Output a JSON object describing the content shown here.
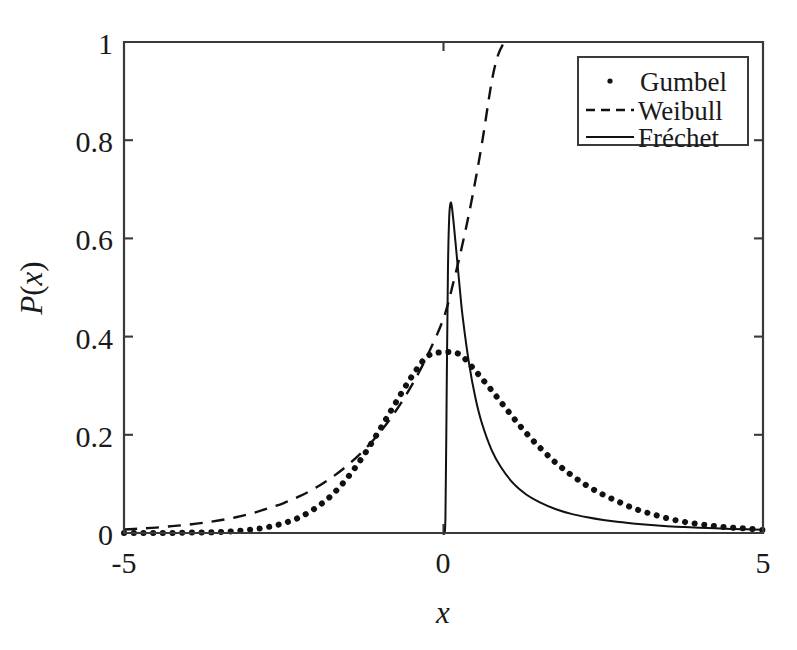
{
  "chart_data": {
    "type": "line",
    "title": "",
    "xlabel": "x",
    "ylabel": "P(x)",
    "xlim": [
      -5,
      5
    ],
    "ylim": [
      0,
      1
    ],
    "grid": false,
    "legend_position": "top-right",
    "xticks": [
      -5,
      0,
      5
    ],
    "xtick_labels": [
      "-5",
      "0",
      "5"
    ],
    "yticks": [
      0,
      0.2,
      0.4,
      0.6,
      0.8,
      1
    ],
    "ytick_labels": [
      "0",
      "0.2",
      "0.4",
      "0.6",
      "0.8",
      "1"
    ],
    "series": [
      {
        "name": "Gumbel",
        "style": "dotted",
        "color": "#111111",
        "x": [
          -5,
          -4.75,
          -4.5,
          -4.25,
          -4,
          -3.75,
          -3.5,
          -3.25,
          -3,
          -2.75,
          -2.5,
          -2.25,
          -2,
          -1.75,
          -1.5,
          -1.25,
          -1,
          -0.75,
          -0.5,
          -0.25,
          0,
          0.25,
          0.5,
          0.75,
          1,
          1.25,
          1.5,
          1.75,
          2,
          2.25,
          2.5,
          2.75,
          3,
          3.25,
          3.5,
          3.75,
          4,
          4.25,
          4.5,
          4.75,
          5
        ],
        "y": [
          0.0,
          0.0,
          0.0,
          0.0,
          0.001,
          0.001,
          0.002,
          0.004,
          0.007,
          0.012,
          0.02,
          0.032,
          0.051,
          0.077,
          0.113,
          0.158,
          0.21,
          0.265,
          0.318,
          0.36,
          0.368,
          0.364,
          0.33,
          0.291,
          0.25,
          0.21,
          0.175,
          0.144,
          0.118,
          0.096,
          0.078,
          0.063,
          0.049,
          0.039,
          0.03,
          0.023,
          0.018,
          0.014,
          0.011,
          0.009,
          0.006
        ]
      },
      {
        "name": "Weibull",
        "style": "dashed",
        "color": "#111111",
        "x": [
          -5,
          -4.75,
          -4.5,
          -4.25,
          -4,
          -3.75,
          -3.5,
          -3.25,
          -3,
          -2.75,
          -2.5,
          -2.25,
          -2,
          -1.75,
          -1.5,
          -1.25,
          -1,
          -0.75,
          -0.5,
          -0.25,
          0,
          0.15,
          0.3,
          0.45,
          0.6,
          0.75,
          0.85,
          0.95
        ],
        "y": [
          0.007,
          0.009,
          0.011,
          0.014,
          0.017,
          0.021,
          0.026,
          0.032,
          0.04,
          0.05,
          0.061,
          0.075,
          0.092,
          0.113,
          0.138,
          0.168,
          0.204,
          0.248,
          0.3,
          0.362,
          0.437,
          0.508,
          0.59,
          0.684,
          0.792,
          0.916,
          0.972,
          1.0
        ]
      },
      {
        "name": "Fréchet",
        "style": "solid",
        "color": "#111111",
        "x": [
          0,
          0.002,
          0.03,
          0.05,
          0.07,
          0.09,
          0.11,
          0.13,
          0.16,
          0.2,
          0.25,
          0.3,
          0.4,
          0.5,
          0.6,
          0.75,
          0.9,
          1.1,
          1.3,
          1.5,
          1.75,
          2,
          2.25,
          2.5,
          2.75,
          3,
          3.25,
          3.5,
          3.75,
          4,
          4.25,
          4.5,
          4.75,
          5
        ],
        "y": [
          0.0,
          0.0,
          0.03,
          0.29,
          0.54,
          0.645,
          0.672,
          0.665,
          0.63,
          0.575,
          0.505,
          0.44,
          0.345,
          0.275,
          0.224,
          0.17,
          0.134,
          0.1,
          0.078,
          0.063,
          0.049,
          0.039,
          0.032,
          0.0265,
          0.0222,
          0.0189,
          0.0162,
          0.014,
          0.0122,
          0.0107,
          0.0095,
          0.0084,
          0.0075,
          0.0068
        ]
      }
    ]
  },
  "legend": {
    "entries": [
      {
        "label": "Gumbel",
        "marker": "dot-marker"
      },
      {
        "label": "Weibull",
        "marker": "dashed-line-marker"
      },
      {
        "label": "Fréchet",
        "marker": "solid-line-marker"
      }
    ]
  },
  "axes": {
    "x_title": "x",
    "y_title_p": "P",
    "y_title_paren_open": "(",
    "y_title_var": "x",
    "y_title_paren_close": ")",
    "x_tick_left": "-5",
    "x_tick_mid": "0",
    "x_tick_right": "5",
    "y_tick_0": "0",
    "y_tick_02": "0.2",
    "y_tick_04": "0.4",
    "y_tick_06": "0.6",
    "y_tick_08": "0.8",
    "y_tick_1": "1"
  },
  "colors": {
    "axis": "#3a3a3a",
    "curve": "#111111",
    "background": "#ffffff"
  }
}
